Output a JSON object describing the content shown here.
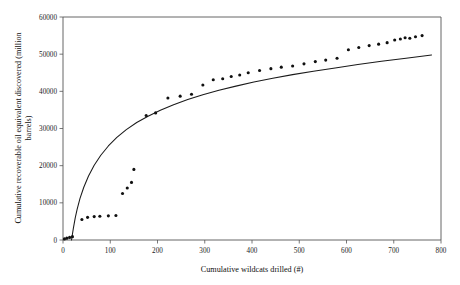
{
  "chart_data": {
    "type": "scatter",
    "title": "",
    "xlabel": "Cumulative wildcats drilled (#)",
    "ylabel": "Cumulative recoverable oil equivalent discovered (million barrels)",
    "xlim": [
      0,
      800
    ],
    "ylim": [
      0,
      60000
    ],
    "xticks": [
      0,
      100,
      200,
      300,
      400,
      500,
      600,
      700,
      800
    ],
    "yticks": [
      0,
      10000,
      20000,
      30000,
      40000,
      50000,
      60000
    ],
    "xtick_labels": [
      "0",
      "100",
      "200",
      "300",
      "400",
      "500",
      "600",
      "700",
      "800"
    ],
    "ytick_labels": [
      "0",
      "10000",
      "20000",
      "30000",
      "40000",
      "50000",
      "60000"
    ],
    "grid": false,
    "legend": null,
    "legend_position": "none",
    "point_color": "#101010",
    "curve_color": "#1a1a1a",
    "frame_color": "#555555",
    "series": [
      {
        "name": "Cumulative discovery (observed)",
        "type": "scatter",
        "marker": "circle",
        "points": [
          [
            3,
            300
          ],
          [
            8,
            500
          ],
          [
            14,
            700
          ],
          [
            20,
            900
          ],
          [
            40,
            5500
          ],
          [
            52,
            6100
          ],
          [
            66,
            6300
          ],
          [
            78,
            6400
          ],
          [
            96,
            6500
          ],
          [
            112,
            6600
          ],
          [
            126,
            12500
          ],
          [
            136,
            14000
          ],
          [
            145,
            15500
          ],
          [
            150,
            19000
          ],
          [
            176,
            33500
          ],
          [
            196,
            34200
          ],
          [
            222,
            38200
          ],
          [
            248,
            38700
          ],
          [
            272,
            39200
          ],
          [
            296,
            41700
          ],
          [
            318,
            43100
          ],
          [
            338,
            43400
          ],
          [
            356,
            44000
          ],
          [
            374,
            44400
          ],
          [
            392,
            45000
          ],
          [
            416,
            45600
          ],
          [
            440,
            46100
          ],
          [
            462,
            46500
          ],
          [
            486,
            46800
          ],
          [
            510,
            47400
          ],
          [
            534,
            48000
          ],
          [
            556,
            48400
          ],
          [
            580,
            48900
          ],
          [
            604,
            51200
          ],
          [
            626,
            51800
          ],
          [
            648,
            52300
          ],
          [
            668,
            52700
          ],
          [
            686,
            53100
          ],
          [
            702,
            53800
          ],
          [
            714,
            54100
          ],
          [
            724,
            54400
          ],
          [
            734,
            54300
          ],
          [
            746,
            54700
          ],
          [
            760,
            55000
          ]
        ]
      },
      {
        "name": "Fitted discovery curve",
        "type": "line",
        "points": [
          [
            18,
            0
          ],
          [
            22,
            3200
          ],
          [
            26,
            6000
          ],
          [
            30,
            8300
          ],
          [
            36,
            11200
          ],
          [
            44,
            14200
          ],
          [
            54,
            17200
          ],
          [
            66,
            20100
          ],
          [
            80,
            22800
          ],
          [
            96,
            25300
          ],
          [
            114,
            27600
          ],
          [
            134,
            29700
          ],
          [
            156,
            31600
          ],
          [
            180,
            33300
          ],
          [
            206,
            34900
          ],
          [
            234,
            36400
          ],
          [
            264,
            37800
          ],
          [
            296,
            39100
          ],
          [
            330,
            40300
          ],
          [
            366,
            41400
          ],
          [
            404,
            42500
          ],
          [
            444,
            43500
          ],
          [
            486,
            44500
          ],
          [
            530,
            45400
          ],
          [
            576,
            46300
          ],
          [
            624,
            47200
          ],
          [
            674,
            48100
          ],
          [
            726,
            48900
          ],
          [
            780,
            49800
          ]
        ]
      }
    ]
  },
  "axes": {
    "x_title": "Cumulative wildcats drilled (#)",
    "y_title_line1": "Cumulative recoverable oil equivalent discovered (million",
    "y_title_line2": "barrels)"
  }
}
